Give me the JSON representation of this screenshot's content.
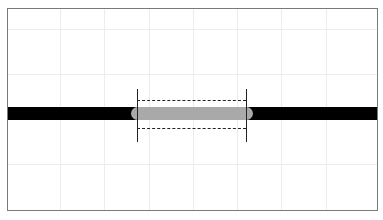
{
  "diagram": {
    "frame": {
      "border_color": "#7a7a7a",
      "background": "#ffffff"
    },
    "grid": {
      "color": "#ececec",
      "vertical_x": [
        52,
        96,
        141,
        185,
        229,
        273,
        318
      ],
      "horizontal_y": [
        20,
        65,
        155
      ]
    },
    "bar": {
      "color": "#000000",
      "label": ""
    },
    "highlight_segment": {
      "color": "#a9a9a9",
      "shape": "capsule"
    },
    "markers": {
      "vertical_solid_lines": 2,
      "horizontal_dashed_lines": 2
    },
    "caption": ""
  }
}
